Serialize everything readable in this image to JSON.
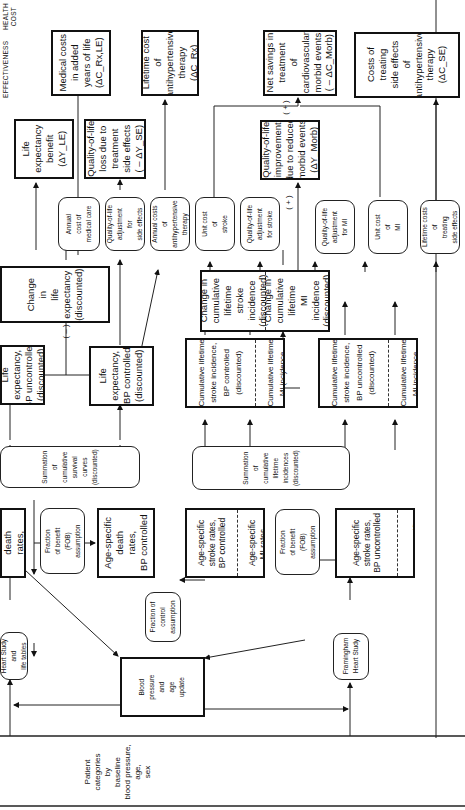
{
  "headers": {
    "effectiveness": "EFFECTIVENESS",
    "health_cost": "HEALTH\nCOST"
  },
  "signs": {
    "minus": "( – )",
    "plus": "( + )"
  },
  "outcomes": {
    "life_expectancy_benefit": "Life\nexpectancy\nbenefit\n(ΔY_LE)",
    "qol_loss_side_effects": "Quality-of-life\nloss due to\ntreatment\nside effects\n( – ΔY_SE)",
    "qol_improvement_morbid": "Quality-of-life\nimprovement\ndue to reduced\nmorbid events\n(ΔY_Morb)",
    "medical_costs_added_years": "Medical costs\nin added\nyears of life\n(ΔC_Rx,LE)",
    "lifetime_cost_therapy": "Lifetime cost\nof\nantihypertensive\ntherapy\n(ΔC_Rx)",
    "net_savings_morbid": "Net savings in\ntreatment\nof\ncardiovascular\nmorbid events\n( – ΔC_Morb)",
    "costs_side_effects": "Costs of\ntreating\nside effects\nof\nantihypertensive\ntherapy\n(ΔC_SE)"
  },
  "parameters": {
    "annual_cost_medical_care": "Annual\ncost of\nmedical care",
    "qol_adjustment_side_effects": "Quality-of-life\nadjustment\nfor\nside effects",
    "annual_costs_therapy": "Annual costs\nof\nantihypertensive\ntherapy",
    "unit_cost_stroke": "Unit cost\nof\nstroke",
    "qol_adjustment_stroke": "Quality-of-life\nadjustment\nfor stroke",
    "qol_adjustment_mi": "Quality-of-life\nadjustment\nfor MI",
    "unit_cost_mi": "Unit cost\nof\nMI",
    "lifetime_costs_side_effects": "Lifetime costs\nof\ntreating\nside effects",
    "fraction_benefit_top": "Fraction\nof benefit\n(FOB)\nassumption",
    "fraction_benefit_bottom": "Fraction\nof benefit\n(FOB)\nassumption",
    "fraction_control": "Fraction of\ncontrol\nassumption",
    "heart_study_life_tables": "Heart Study\nand\nlife tables",
    "framingham": "Framingham\nHeart Study",
    "summation_survival": "Summation\nof\ncumulative\nsurvival\ncurves\n(discounted)",
    "summation_incidence": "Summation\nof\ncumulative\nlifetime\nincidences\n(discounted)"
  },
  "process": {
    "change_life_expectancy": "Change\nin\nlife\nexpectancy\n(discounted)",
    "life_exp_uncontrolled": "Life\nexpectancy,\nBP uncontrolled\n(discounted)",
    "life_exp_controlled": "Life\nexpectancy,\nBP controlled\n(discounted)",
    "death_rates_uncontrolled": "Age-specific\ndeath\nrates,\nBP uncontrolled",
    "death_rates_controlled": "Age-specific\ndeath\nrates,\nBP controlled",
    "change_stroke": "Change in\ncumulative\nlifetime\nstroke\nincidence\n(discounted)",
    "change_mi": "Change in\ncumulative\nlifetime\nMI\nincidence\n(discounted)",
    "cum_stroke_controlled": "Cumulative lifetime\nstroke incidence,\nBP controlled\n(discounted)",
    "cum_mi_controlled": "Cumulative lifetime\nMI incidence,\nBP controlled\n(discounted)",
    "cum_stroke_uncontrolled": "Cumulative lifetime\nstroke incidence,\nBP uncontrolled\n(discounted)",
    "cum_mi_uncontrolled": "Cumulative lifetime\nMI incidence,\nBP uncontrolled\n(discounted)",
    "stroke_rates_controlled": "Age-specific\nstroke rates,\nBP controlled",
    "mi_rates_controlled": "Age-specific\nMI rates,\nBP controlled",
    "stroke_rates_uncontrolled": "Age-specific\nstroke rates,\nBP uncontrolled",
    "mi_rates_uncontrolled": "Age-specific\nMI rates,\nBP uncontrolled",
    "bp_age_update": "Blood\npressure\nand\nage\nupdate",
    "patient_categories": "Patient\ncategories\nby\nbaseline\nblood pressure,\nage,\nsex"
  }
}
